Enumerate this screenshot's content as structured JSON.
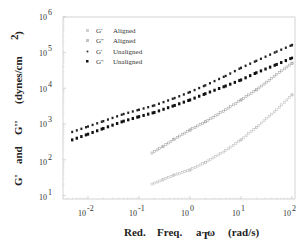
{
  "chart_data": {
    "type": "scatter",
    "title": "",
    "xlabel": "Red.  Freq.  a_T ω  (rad/s)",
    "ylabel": "G'  and  G''  (dynes/cm²)",
    "xscale": "log",
    "yscale": "log",
    "xlim": [
      0.003,
      120
    ],
    "ylim": [
      10,
      1000000
    ],
    "grid": false,
    "legend_position": "upper left",
    "x_ticks": [
      "10^-2",
      "10^-1",
      "10^0",
      "10^1",
      "10^2"
    ],
    "y_ticks": [
      "10^1",
      "10^2",
      "10^3",
      "10^4",
      "10^5",
      "10^6"
    ],
    "series": [
      {
        "name": "G'  Aligned",
        "marker": "open-light",
        "color": "#b8b8b8",
        "x": [
          0.18,
          0.3,
          0.5,
          1,
          2,
          5,
          10,
          20,
          50,
          100
        ],
        "y": [
          21,
          28,
          38,
          52,
          85,
          180,
          360,
          800,
          2500,
          6500
        ]
      },
      {
        "name": "G''  Aligned",
        "marker": "open-light",
        "color": "#9a9a9a",
        "x": [
          0.18,
          0.3,
          0.5,
          1,
          2,
          5,
          10,
          20,
          50,
          100
        ],
        "y": [
          155,
          240,
          380,
          680,
          1150,
          2500,
          4700,
          9000,
          24000,
          50000
        ]
      },
      {
        "name": "G'  Unaligned",
        "marker": "filled-small",
        "color": "#222222",
        "x": [
          0.0049,
          0.01,
          0.02,
          0.05,
          0.1,
          0.2,
          0.5,
          1,
          2,
          5,
          10,
          20,
          50,
          100
        ],
        "y": [
          600,
          850,
          1200,
          1900,
          2500,
          3300,
          5300,
          7800,
          12000,
          22000,
          37000,
          58000,
          105000,
          160000
        ]
      },
      {
        "name": "G''  Unaligned",
        "marker": "filled-square",
        "color": "#111111",
        "x": [
          0.0049,
          0.01,
          0.02,
          0.05,
          0.1,
          0.2,
          0.5,
          1,
          2,
          5,
          10,
          20,
          50,
          100
        ],
        "y": [
          360,
          520,
          750,
          1200,
          1600,
          2100,
          3300,
          4700,
          7000,
          11500,
          17000,
          27000,
          46000,
          70000
        ]
      }
    ]
  },
  "axes": {
    "x_title_parts": [
      "Red.",
      "Freq.",
      "a",
      "T",
      "ω",
      "(rad/s)"
    ],
    "y_title_parts": [
      "G'",
      "and",
      "G''",
      "(dynes/cm",
      "2",
      ")"
    ],
    "x_tick_base": "10",
    "x_tick_exps": [
      "-2",
      "-1",
      "0",
      "1",
      "2"
    ],
    "y_tick_base": "10",
    "y_tick_exps": [
      "6",
      "5",
      "4",
      "3",
      "2",
      "1"
    ]
  },
  "legend": {
    "items": [
      {
        "label_sym": "G'",
        "label_text": "Aligned"
      },
      {
        "label_sym": "G''",
        "label_text": "Aligned"
      },
      {
        "label_sym": "G'",
        "label_text": "Unaligned"
      },
      {
        "label_sym": "G''",
        "label_text": "Unaligned"
      }
    ]
  }
}
